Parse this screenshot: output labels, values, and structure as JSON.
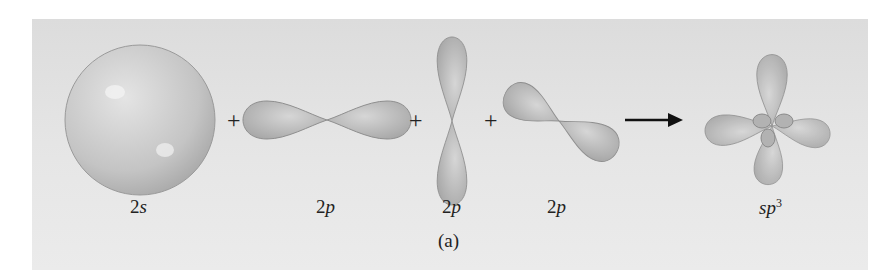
{
  "figure": {
    "caption": "(a)",
    "operators": {
      "plus": "+",
      "arrow": "reaction-arrow"
    },
    "orbitals": [
      {
        "id": "2s",
        "label_main": "2",
        "label_sub": "s",
        "shape": "sphere"
      },
      {
        "id": "2px",
        "label_main": "2",
        "label_sub": "p",
        "shape": "horizontal-dumbbell"
      },
      {
        "id": "2py",
        "label_main": "2",
        "label_sub": "p",
        "shape": "vertical-dumbbell"
      },
      {
        "id": "2pz",
        "label_main": "2",
        "label_sub": "p",
        "shape": "diagonal-dumbbell"
      },
      {
        "id": "sp3",
        "label_main": "sp",
        "label_sup": "3",
        "shape": "four-lobe-hybrid"
      }
    ],
    "colors": {
      "lobe": "#b8b8b8",
      "lobe_edge": "#8a8a8a",
      "background": "#e2e2e2"
    }
  }
}
